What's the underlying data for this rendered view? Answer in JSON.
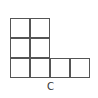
{
  "diagram": {
    "type": "grid-shape",
    "cell_size": 20,
    "line_color": "#555555",
    "cells": [
      {
        "row": 0,
        "col": 0
      },
      {
        "row": 0,
        "col": 1
      },
      {
        "row": 1,
        "col": 0
      },
      {
        "row": 1,
        "col": 1
      },
      {
        "row": 2,
        "col": 0
      },
      {
        "row": 2,
        "col": 1
      },
      {
        "row": 2,
        "col": 2
      },
      {
        "row": 2,
        "col": 3
      }
    ],
    "point_label": "C"
  }
}
